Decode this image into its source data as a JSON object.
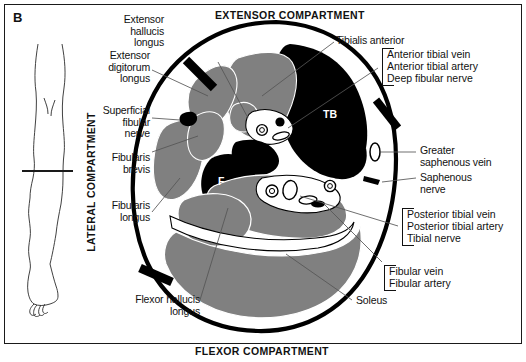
{
  "figure": {
    "panel_letter": "B",
    "caption_headers": {
      "top": "EXTENSOR COMPARTMENT",
      "bottom": "FLEXOR COMPARTMENT",
      "left_vertical": "LATERAL COMPARTMENT"
    }
  },
  "colors": {
    "muscle_fill": "#808080",
    "bone_fill": "#000000",
    "fascia_outline": "#000000",
    "septum": "#000000",
    "background": "#ffffff",
    "intermuscular_white": "#ffffff",
    "leader_line": "#555555",
    "frame_border": "#1a1a1a"
  },
  "bone_tags": [
    {
      "abbrev": "TB",
      "name": "tibia"
    },
    {
      "abbrev": "F",
      "name": "fibula"
    }
  ],
  "labels_left": [
    {
      "id": "extensor-hallucis-longus",
      "lines": "Extensor\nhallucis\nlongus"
    },
    {
      "id": "extensor-digitorum-longus",
      "lines": "Extensor\ndigitorum\nlongus"
    },
    {
      "id": "superficial-fibular-nerve",
      "lines": "Superficial\nfibular\nnerve"
    },
    {
      "id": "fibularis-brevis",
      "lines": "Fibularis\nbrevis"
    },
    {
      "id": "fibularis-longus",
      "lines": "Fibularis\nlongus"
    },
    {
      "id": "flexor-hallucis-longus",
      "lines": "Flexor hallucis\nlongus"
    }
  ],
  "labels_right": [
    {
      "id": "tibialis-anterior",
      "lines": "Tibialis anterior"
    },
    {
      "id": "greater-saphenous-vein",
      "lines": "Greater\nsaphenous vein"
    },
    {
      "id": "saphenous-nerve",
      "lines": "Saphenous\nnerve"
    },
    {
      "id": "soleus",
      "lines": "Soleus"
    }
  ],
  "bracket_groups": [
    {
      "id": "anterior-neurovascular-bundle",
      "items": [
        "Anterior tibial vein",
        "Anterior tibial artery",
        "Deep fibular nerve"
      ]
    },
    {
      "id": "posterior-neurovascular-bundle",
      "items": [
        "Posterior tibial vein",
        "Posterior tibial artery",
        "Tibial nerve"
      ]
    },
    {
      "id": "fibular-vessels",
      "items": [
        "Fibular vein",
        "Fibular artery"
      ]
    }
  ],
  "inset": {
    "id": "leg-orientation-inset",
    "description": "line drawing of lower limb with transverse section level line"
  }
}
